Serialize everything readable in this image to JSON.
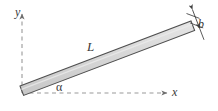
{
  "figure": {
    "type": "engineering-diagram",
    "background_color": "#ffffff",
    "labels": {
      "y_axis": "y",
      "x_axis": "x",
      "length": "L",
      "width": "b",
      "angle": "α"
    },
    "colors": {
      "bar_fill": "#d2d2d2",
      "bar_fill_highlight": "#e4e4e4",
      "bar_outline": "#4a4a4a",
      "axis_line": "#8a8a8a",
      "dimension_line": "#4a4a4a",
      "label_text": "#3a3a3a"
    },
    "axes": {
      "origin": [
        22,
        93
      ],
      "x_axis": {
        "style": "dashed",
        "direction": "right",
        "arrowhead": true,
        "end": [
          168,
          93
        ]
      },
      "y_axis": {
        "style": "dashed",
        "direction": "up",
        "arrowhead": true,
        "end": [
          22,
          13
        ]
      }
    },
    "bar": {
      "shape": "parallelogram",
      "left_end": [
        20,
        86
      ],
      "right_end": [
        191,
        21
      ],
      "thickness_px": 10,
      "angle_degrees": 21
    },
    "dimension_b": {
      "style": "double-headed-arrow",
      "extension_ticks": 2,
      "perpendicular_to_bar": true
    }
  }
}
